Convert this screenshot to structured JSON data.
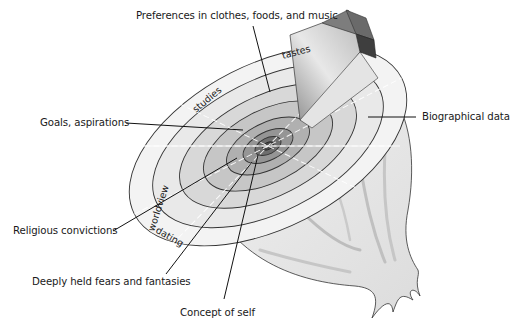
{
  "diagram": {
    "type": "onion model (layers of self-disclosure)",
    "callouts": {
      "preferences": "Preferences in clothes, foods, and music",
      "goals": "Goals, aspirations",
      "religious": "Religious convictions",
      "fears": "Deeply held fears and fantasies",
      "concept": "Concept of self",
      "biographical": "Biographical data"
    },
    "breadth_labels": {
      "tastes": "tastes",
      "studies": "studies",
      "worldview": "worldview",
      "dating": "dating"
    },
    "colors": {
      "outer_ring": "#f2f2f2",
      "ring2": "#d9d9d9",
      "ring3": "#c4c4c4",
      "ring4": "#a8a8a8",
      "core": "#5a5a5a",
      "onion_body": "#e6e6e6",
      "wedge_dark": "#3c3c3c",
      "outline": "#333333"
    }
  }
}
